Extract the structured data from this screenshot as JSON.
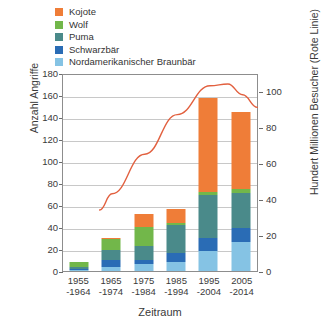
{
  "chart_data": {
    "type": "bar",
    "subtype": "stacked-bar-with-line",
    "title": "",
    "xlabel": "Zeitraum",
    "ylabel": "Anzahl Angriffe",
    "y2label": "Hundert Millionen Besucher (Rote Linie)",
    "categories": [
      "1955\n-1964",
      "1965\n-1974",
      "1975\n-1984",
      "1985\n-1994",
      "1995\n-2004",
      "2005\n-2014"
    ],
    "category_lines": [
      [
        "1955",
        "-1964"
      ],
      [
        "1965",
        "-1974"
      ],
      [
        "1975",
        "-1984"
      ],
      [
        "1985",
        "-1994"
      ],
      [
        "1995",
        "-2004"
      ],
      [
        "2005",
        "-2014"
      ]
    ],
    "ylim": [
      0,
      180
    ],
    "yticks": [
      0,
      20,
      40,
      60,
      80,
      100,
      120,
      140,
      160,
      180
    ],
    "y2lim": [
      0,
      110
    ],
    "y2ticks": [
      0,
      20,
      40,
      60,
      80,
      100
    ],
    "grid": true,
    "legend_position": "top-left",
    "stack_order_bottom_to_top": [
      "Nordamerikanischer Braunbär",
      "Schwarzbär",
      "Puma",
      "Wolf",
      "Kojote"
    ],
    "series": [
      {
        "name": "Kojote",
        "color": "#ef7d38",
        "values": [
          0,
          1,
          12,
          12,
          85,
          70
        ]
      },
      {
        "name": "Wolf",
        "color": "#72b74a",
        "values": [
          4,
          10,
          17,
          2,
          3,
          4
        ]
      },
      {
        "name": "Puma",
        "color": "#4a8a8a",
        "values": [
          2,
          9,
          13,
          26,
          39,
          32
        ]
      },
      {
        "name": "Schwarzbär",
        "color": "#2a6cb5",
        "values": [
          1,
          6,
          4,
          8,
          12,
          13
        ]
      },
      {
        "name": "Nordamerikanischer Braunbär",
        "color": "#85c3e4",
        "values": [
          1,
          4,
          6,
          8,
          18,
          26
        ]
      }
    ],
    "totals": [
      8,
      30,
      52,
      56,
      157,
      145
    ],
    "line_series": {
      "name": "Hundert Millionen Besucher",
      "color": "#e2603f",
      "axis": "right",
      "x": [
        0.62,
        1.0,
        2.0,
        3.0,
        4.0,
        4.55,
        5.0,
        5.45
      ],
      "values": [
        35,
        44,
        66,
        88,
        104,
        105,
        99,
        92
      ]
    }
  },
  "legend": {
    "items": [
      {
        "label": "Kojote",
        "color": "#ef7d38"
      },
      {
        "label": "Wolf",
        "color": "#72b74a"
      },
      {
        "label": "Puma",
        "color": "#4a8a8a"
      },
      {
        "label": "Schwarzbär",
        "color": "#2a6cb5"
      },
      {
        "label": "Nordamerikanischer Braunbär",
        "color": "#85c3e4"
      }
    ]
  }
}
